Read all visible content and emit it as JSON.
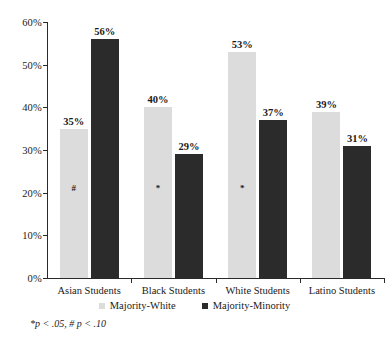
{
  "chart_data": {
    "type": "bar",
    "title": "",
    "xlabel": "",
    "ylabel": "",
    "categories": [
      "Asian Students",
      "Black Students",
      "White Students",
      "Latino Students"
    ],
    "series": [
      {
        "name": "Majority-White",
        "color": "#dcdcdc",
        "values": [
          35,
          40,
          53,
          39
        ],
        "labels": [
          "35%",
          "40%",
          "53%",
          "39%"
        ],
        "significance": [
          "#",
          "*",
          "*",
          ""
        ]
      },
      {
        "name": "Majority-Minority",
        "color": "#2b2b2b",
        "values": [
          56,
          29,
          37,
          31
        ],
        "labels": [
          "56%",
          "29%",
          "37%",
          "31%"
        ],
        "significance": [
          "",
          "",
          "",
          ""
        ]
      }
    ],
    "ylim": [
      0,
      60
    ],
    "yticks": [
      0,
      10,
      20,
      30,
      40,
      50,
      60
    ],
    "ytick_labels": [
      "0%",
      "10%",
      "20%",
      "30%",
      "40%",
      "50%",
      "60%"
    ],
    "grid": false,
    "legend_position": "bottom"
  },
  "axis": {
    "y_labels": [
      "60%",
      "50%",
      "40%",
      "30%",
      "20%",
      "10%",
      "0%"
    ]
  },
  "legend": {
    "items": [
      {
        "label": "Majority-White",
        "color": "#dcdcdc"
      },
      {
        "label": "Majority-Minority",
        "color": "#2b2b2b"
      }
    ]
  },
  "footnote": {
    "text": "*p < .05, # p < .10"
  }
}
